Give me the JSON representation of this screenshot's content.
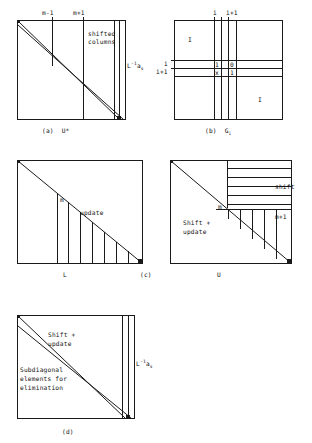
{
  "figure": {
    "panels": [
      {
        "id": "a",
        "caption": "(a)  U*",
        "labels": {
          "top_left": "m-1",
          "top_right": "m+1",
          "interior_line1": "shifted",
          "interior_line2": "columns",
          "right_main": "L",
          "right_sup": "-1",
          "right_var": "a",
          "right_sub": "s"
        }
      },
      {
        "id": "b",
        "caption": "(b)  G",
        "caption_sub": "i",
        "labels": {
          "top_col1": "i",
          "top_col2": "i+1",
          "left_row1": "i",
          "left_row2": "i+1",
          "identity_upper": "I",
          "identity_lower": "I",
          "cell_11": "1",
          "cell_12": "0",
          "cell_21": "x",
          "cell_22": "1"
        }
      },
      {
        "id": "c",
        "caption": "(c)",
        "labels": {
          "diagonal_mark": "m",
          "update": "update",
          "bottom": "L"
        }
      },
      {
        "id": "u",
        "caption": "",
        "labels": {
          "diagonal_mark": "m",
          "shift": "shift",
          "row_marker": "m+1",
          "shift_update_line1": "Shift +",
          "shift_update_line2": "update",
          "bottom": "U"
        }
      },
      {
        "id": "d",
        "caption": "(d)",
        "labels": {
          "shift_update_line1": "Shift +",
          "shift_update_line2": "update",
          "subdiag_line1": "Subdiagonal",
          "subdiag_line2": "elements for",
          "subdiag_line3": "elimination",
          "right_main": "L",
          "right_sup": "-1",
          "right_var": "a",
          "right_sub": "s"
        }
      }
    ]
  },
  "colors": {
    "ink": "#1a1a1a",
    "paper": "#ffffff"
  }
}
